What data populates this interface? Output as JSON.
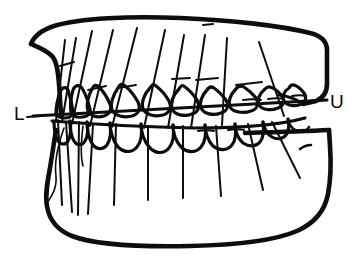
{
  "figure": {
    "kind": "line-drawing",
    "background_color": "#ffffff",
    "ink_color": "#0d0d0d",
    "width": 358,
    "height": 262
  },
  "labels": {
    "lower_label": "L",
    "lower_label_x": 14,
    "lower_label_y": 120,
    "upper_label": "U",
    "upper_label_x": 330,
    "upper_label_y": 108
  },
  "occlusal_plane": {
    "name": "occlusal-plane-line",
    "left_point": [
      33,
      116
    ],
    "right_point": [
      327,
      100
    ],
    "dash_left": [
      27,
      117,
      40,
      116
    ]
  },
  "upper_arch": {
    "name": "maxilla",
    "tooth_count": 10,
    "axis_lines": [
      {
        "id": "u1",
        "x1": 65,
        "y1": 40,
        "x2": 56,
        "y2": 120
      },
      {
        "id": "u2",
        "x1": 76,
        "y1": 38,
        "x2": 62,
        "y2": 122
      },
      {
        "id": "u3",
        "x1": 92,
        "y1": 31,
        "x2": 72,
        "y2": 124
      },
      {
        "id": "u4",
        "x1": 113,
        "y1": 30,
        "x2": 90,
        "y2": 126
      },
      {
        "id": "u5",
        "x1": 137,
        "y1": 28,
        "x2": 112,
        "y2": 127
      },
      {
        "id": "u6",
        "x1": 165,
        "y1": 30,
        "x2": 144,
        "y2": 128
      },
      {
        "id": "u7",
        "x1": 184,
        "y1": 35,
        "x2": 168,
        "y2": 128
      },
      {
        "id": "u8",
        "x1": 205,
        "y1": 35,
        "x2": 191,
        "y2": 128
      },
      {
        "id": "u9",
        "x1": 227,
        "y1": 38,
        "x2": 222,
        "y2": 125
      },
      {
        "id": "u10",
        "x1": 259,
        "y1": 42,
        "x2": 284,
        "y2": 116
      }
    ]
  },
  "lower_arch": {
    "name": "mandible",
    "tooth_count": 10,
    "axis_lines": [
      {
        "id": "l1",
        "x1": 58,
        "y1": 120,
        "x2": 62,
        "y2": 205
      },
      {
        "id": "l2",
        "x1": 66,
        "y1": 122,
        "x2": 72,
        "y2": 212
      },
      {
        "id": "l3",
        "x1": 79,
        "y1": 122,
        "x2": 78,
        "y2": 215
      },
      {
        "id": "l4",
        "x1": 93,
        "y1": 124,
        "x2": 88,
        "y2": 214
      },
      {
        "id": "l5",
        "x1": 116,
        "y1": 124,
        "x2": 114,
        "y2": 205
      },
      {
        "id": "l6",
        "x1": 148,
        "y1": 126,
        "x2": 148,
        "y2": 200
      },
      {
        "id": "l7",
        "x1": 183,
        "y1": 126,
        "x2": 183,
        "y2": 198
      },
      {
        "id": "l8",
        "x1": 216,
        "y1": 126,
        "x2": 221,
        "y2": 196
      },
      {
        "id": "l9",
        "x1": 248,
        "y1": 124,
        "x2": 263,
        "y2": 190
      },
      {
        "id": "l10",
        "x1": 272,
        "y1": 122,
        "x2": 300,
        "y2": 178
      }
    ]
  },
  "annotations": {
    "hash_marks": [
      {
        "id": "h1",
        "x1": 60,
        "y1": 66,
        "x2": 74,
        "y2": 62
      },
      {
        "id": "h2",
        "x1": 88,
        "y1": 90,
        "x2": 106,
        "y2": 86
      },
      {
        "id": "h3",
        "x1": 118,
        "y1": 88,
        "x2": 136,
        "y2": 85
      },
      {
        "id": "h4",
        "x1": 172,
        "y1": 79,
        "x2": 190,
        "y2": 78
      },
      {
        "id": "h5",
        "x1": 196,
        "y1": 80,
        "x2": 218,
        "y2": 78
      },
      {
        "id": "h6",
        "x1": 236,
        "y1": 85,
        "x2": 262,
        "y2": 82
      }
    ]
  }
}
